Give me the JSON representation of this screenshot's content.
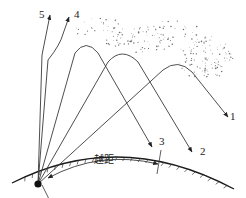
{
  "rays": [
    {
      "id": "1",
      "label": "1",
      "behavior": "refracted back, lands far"
    },
    {
      "id": "2",
      "label": "2",
      "behavior": "refracted back"
    },
    {
      "id": "3",
      "label": "3",
      "behavior": "refracted back, lands at skip boundary"
    },
    {
      "id": "4",
      "label": "4",
      "behavior": "penetrates ionosphere"
    },
    {
      "id": "5",
      "label": "5",
      "behavior": "penetrates ionosphere"
    }
  ],
  "skip_distance_label": "越距",
  "transmitter": "transmitter",
  "colors": {
    "line": "#3a3a3a",
    "earth": "#1a1a1a",
    "ionosphere_dots": "#6b6b6b"
  }
}
